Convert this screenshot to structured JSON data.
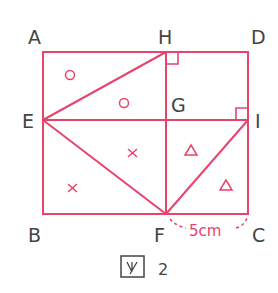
{
  "diagram": {
    "caption": "図 2",
    "caption_box": "図",
    "caption_number": "2",
    "colors": {
      "line": "#e8436a",
      "label": "#444444"
    },
    "points": {
      "A": "A",
      "H": "H",
      "D": "D",
      "E": "E",
      "G": "G",
      "I": "I",
      "B": "B",
      "F": "F",
      "C": "C"
    },
    "measurement": {
      "segment": "FC",
      "label": "5cm"
    },
    "marks": {
      "circle": "○",
      "cross": "×",
      "triangle": "△"
    }
  }
}
